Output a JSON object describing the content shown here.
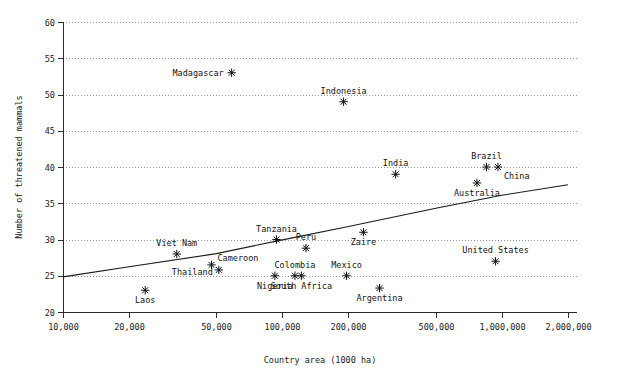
{
  "chart_data": {
    "type": "scatter",
    "title": "",
    "xlabel": "Country area (1000 ha)",
    "ylabel": "Number of threatened mammals",
    "xscale": "log",
    "xlim": [
      10000,
      2200000
    ],
    "ylim": [
      20,
      60
    ],
    "grid": true,
    "legend": false,
    "x_ticks": [
      10000,
      20000,
      50000,
      100000,
      200000,
      500000,
      1000000,
      2000000
    ],
    "x_tick_labels": [
      "10,000",
      "20,000",
      "50,000",
      "100,000",
      "200,000",
      "500,000",
      "1,000,000",
      "2,000,000"
    ],
    "y_ticks": [
      20,
      25,
      30,
      35,
      40,
      45,
      50,
      55,
      60
    ],
    "y_tick_labels": [
      "20",
      "25",
      "30",
      "35",
      "40",
      "45",
      "50",
      "55",
      "60"
    ],
    "points": [
      {
        "name": "Madagascar",
        "x": 58700,
        "y": 53.0,
        "label_pos": "left"
      },
      {
        "name": "Indonesia",
        "x": 190000,
        "y": 49.0,
        "label_pos": "above"
      },
      {
        "name": "India",
        "x": 328000,
        "y": 39.0,
        "label_pos": "above"
      },
      {
        "name": "Brazil",
        "x": 851000,
        "y": 40.0,
        "label_pos": "above"
      },
      {
        "name": "China",
        "x": 960000,
        "y": 40.0,
        "label_pos": "right-below"
      },
      {
        "name": "Australia",
        "x": 770000,
        "y": 37.8,
        "label_pos": "below"
      },
      {
        "name": "Zaire",
        "x": 234000,
        "y": 31.0,
        "label_pos": "below"
      },
      {
        "name": "Tanzania",
        "x": 94000,
        "y": 30.0,
        "label_pos": "above"
      },
      {
        "name": "Peru",
        "x": 128000,
        "y": 28.8,
        "label_pos": "above"
      },
      {
        "name": "Viet Nam",
        "x": 33000,
        "y": 28.0,
        "label_pos": "above"
      },
      {
        "name": "United States",
        "x": 936000,
        "y": 27.0,
        "label_pos": "above"
      },
      {
        "name": "Cameroon",
        "x": 47500,
        "y": 26.5,
        "label_pos": "right-above"
      },
      {
        "name": "Thailand",
        "x": 51300,
        "y": 25.8,
        "label_pos": "left-below"
      },
      {
        "name": "Nigeria",
        "x": 92400,
        "y": 25.0,
        "label_pos": "below"
      },
      {
        "name": "Colombia",
        "x": 114000,
        "y": 25.0,
        "label_pos": "above"
      },
      {
        "name": "South Africa",
        "x": 122000,
        "y": 25.0,
        "label_pos": "below"
      },
      {
        "name": "Mexico",
        "x": 196000,
        "y": 25.0,
        "label_pos": "above"
      },
      {
        "name": "Argentina",
        "x": 277000,
        "y": 23.3,
        "label_pos": "below"
      },
      {
        "name": "Laos",
        "x": 23700,
        "y": 23.0,
        "label_pos": "below"
      }
    ],
    "trend_line": {
      "type": "fitted-curve",
      "points": [
        {
          "x": 10000,
          "y": 24.85
        },
        {
          "x": 20000,
          "y": 26.25
        },
        {
          "x": 50000,
          "y": 28.05
        },
        {
          "x": 100000,
          "y": 29.95
        },
        {
          "x": 200000,
          "y": 31.8
        },
        {
          "x": 500000,
          "y": 34.3
        },
        {
          "x": 1000000,
          "y": 36.1
        },
        {
          "x": 2000000,
          "y": 37.55
        }
      ]
    }
  }
}
